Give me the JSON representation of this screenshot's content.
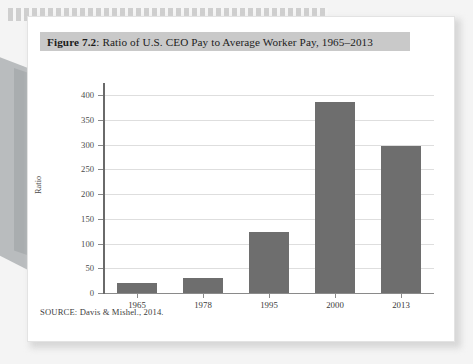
{
  "figure": {
    "label": "Figure 7.2",
    "separator": ":",
    "caption": " Ratio of U.S. CEO Pay to Average Worker Pay, 1965–2013",
    "source_note": "SOURCE: Davis & Mishel., 2014."
  },
  "colors": {
    "bar": "#6e6e6e",
    "title_band": "#c9c9c9",
    "gridline": "#dedede",
    "axis": "#6a6a6a",
    "page": "#ffffff",
    "backdrop": "#f4f4f4"
  },
  "chart_data": {
    "type": "bar",
    "title": "Figure 7.2: Ratio of U.S. CEO Pay to Average Worker Pay, 1965–2013",
    "xlabel": "",
    "ylabel": "Ratio",
    "categories": [
      "1965",
      "1978",
      "1995",
      "2000",
      "2013"
    ],
    "values": [
      20,
      30,
      123,
      385,
      297
    ],
    "ylim": [
      0,
      400
    ],
    "yticks": [
      0,
      50,
      100,
      150,
      200,
      250,
      300,
      350,
      400
    ],
    "ytick_labels": [
      "0",
      "50",
      "100",
      "150",
      "200",
      "250",
      "300",
      "350",
      "400"
    ],
    "grid": true,
    "legend": false,
    "series": [
      {
        "name": "CEO-to-worker pay ratio",
        "values": [
          20,
          30,
          123,
          385,
          297
        ]
      }
    ]
  }
}
